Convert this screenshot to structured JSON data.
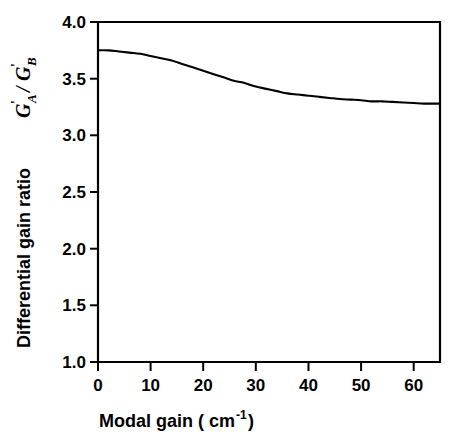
{
  "chart_data": {
    "type": "line",
    "title": "",
    "xlabel": "Modal gain  ( cm-1 )",
    "xlabel_main": "Modal gain  ( cm",
    "xlabel_sup": "-1",
    "xlabel_tail": " )",
    "ylabel_text": "Differential gain ratio",
    "ylabel_symbol_g1": "G",
    "ylabel_symbol_prime1": "'",
    "ylabel_symbol_sub1": "A",
    "ylabel_symbol_slash": "/",
    "ylabel_symbol_g2": "G",
    "ylabel_symbol_prime2": "'",
    "ylabel_symbol_sub2": "B",
    "xlim": [
      0,
      65
    ],
    "ylim": [
      1.0,
      4.0
    ],
    "xticks": [
      0,
      10,
      20,
      30,
      40,
      50,
      60
    ],
    "xtick_labels": [
      "0",
      "10",
      "20",
      "30",
      "40",
      "50",
      "60"
    ],
    "yticks": [
      1.0,
      1.5,
      2.0,
      2.5,
      3.0,
      3.5,
      4.0
    ],
    "ytick_labels": [
      "1.0",
      "1.5",
      "2.0",
      "2.5",
      "3.0",
      "3.5",
      "4.0"
    ],
    "grid": false,
    "legend": false,
    "legend_position": "none",
    "line_color": "#000000",
    "background_color": "#ffffff",
    "series": [
      {
        "name": "differential gain ratio",
        "x": [
          0,
          2,
          4,
          6,
          8,
          10,
          12,
          14,
          16,
          18,
          20,
          22,
          24,
          26,
          28,
          30,
          32,
          34,
          36,
          38,
          40,
          42,
          44,
          46,
          48,
          50,
          52,
          54,
          56,
          58,
          60,
          62,
          65
        ],
        "y": [
          3.75,
          3.75,
          3.74,
          3.73,
          3.72,
          3.7,
          3.68,
          3.66,
          3.63,
          3.6,
          3.57,
          3.54,
          3.51,
          3.48,
          3.46,
          3.43,
          3.41,
          3.39,
          3.37,
          3.36,
          3.35,
          3.34,
          3.33,
          3.32,
          3.315,
          3.31,
          3.3,
          3.3,
          3.295,
          3.29,
          3.285,
          3.28,
          3.28
        ]
      }
    ]
  }
}
